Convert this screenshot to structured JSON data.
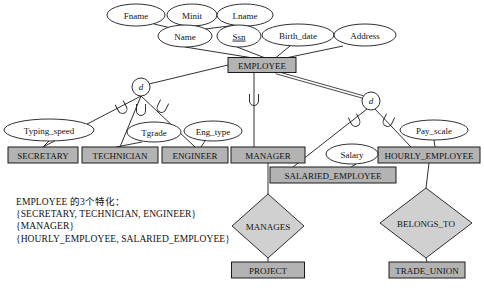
{
  "diagram": {
    "colors": {
      "entity_fill": "#b3b3b3",
      "relationship_fill": "#d0d0d0",
      "attribute_fill": "#ffffff",
      "line": "#1a1a1a",
      "text": "#111111"
    },
    "entities": [
      {
        "id": "employee",
        "label": "EMPLOYEE",
        "x": 262,
        "y": 65,
        "w": 68,
        "h": 15
      },
      {
        "id": "secretary",
        "label": "SECRETARY",
        "x": 43,
        "y": 155,
        "w": 70,
        "h": 16
      },
      {
        "id": "technician",
        "label": "TECHNICIAN",
        "x": 120,
        "y": 155,
        "w": 76,
        "h": 16
      },
      {
        "id": "engineer",
        "label": "ENGINEER",
        "x": 195,
        "y": 155,
        "w": 66,
        "h": 16
      },
      {
        "id": "manager",
        "label": "MANAGER",
        "x": 268,
        "y": 155,
        "w": 74,
        "h": 16
      },
      {
        "id": "hourly_employee",
        "label": "HOURLY_EMPLOYEE",
        "x": 429,
        "y": 155,
        "w": 102,
        "h": 16
      },
      {
        "id": "salaried_employee",
        "label": "SALARIED_EMPLOYEE",
        "x": 333,
        "y": 175,
        "w": 126,
        "h": 16
      },
      {
        "id": "project",
        "label": "PROJECT",
        "x": 268,
        "y": 270,
        "w": 73,
        "h": 16
      },
      {
        "id": "trade_union",
        "label": "TRADE_UNION",
        "x": 427,
        "y": 270,
        "w": 76,
        "h": 16
      }
    ],
    "attributes": [
      {
        "id": "fname",
        "label": "Fname",
        "x": 136,
        "y": 15,
        "rx": 29,
        "ry": 11,
        "key": false
      },
      {
        "id": "minit",
        "label": "Minit",
        "x": 192,
        "y": 15,
        "rx": 25,
        "ry": 11,
        "key": false
      },
      {
        "id": "lname",
        "label": "Lname",
        "x": 245,
        "y": 15,
        "rx": 28,
        "ry": 11,
        "key": false
      },
      {
        "id": "name",
        "label": "Name",
        "x": 185,
        "y": 36,
        "rx": 27,
        "ry": 11,
        "key": false
      },
      {
        "id": "ssn",
        "label": "Ssn",
        "x": 239,
        "y": 36,
        "rx": 22,
        "ry": 11,
        "key": true
      },
      {
        "id": "birth_date",
        "label": "Birth_date",
        "x": 298,
        "y": 35,
        "rx": 36,
        "ry": 11,
        "key": false
      },
      {
        "id": "address",
        "label": "Address",
        "x": 365,
        "y": 35,
        "rx": 31,
        "ry": 11,
        "key": false
      },
      {
        "id": "typing_speed",
        "label": "Typing_speed",
        "x": 49,
        "y": 130,
        "rx": 45,
        "ry": 11,
        "key": false
      },
      {
        "id": "tgrade",
        "label": "Tgrade",
        "x": 154,
        "y": 132,
        "rx": 27,
        "ry": 10,
        "key": false
      },
      {
        "id": "eng_type",
        "label": "Eng_type",
        "x": 213,
        "y": 131,
        "rx": 29,
        "ry": 10,
        "key": false
      },
      {
        "id": "salary",
        "label": "Salary",
        "x": 352,
        "y": 154,
        "rx": 26,
        "ry": 10,
        "key": false
      },
      {
        "id": "pay_scale",
        "label": "Pay_scale",
        "x": 434,
        "y": 130,
        "rx": 34,
        "ry": 10,
        "key": false
      }
    ],
    "specialization_circles": [
      {
        "id": "d-left",
        "label": "d",
        "x": 141,
        "y": 87,
        "r": 9
      },
      {
        "id": "d-right",
        "label": "d",
        "x": 371,
        "y": 101,
        "r": 9
      }
    ],
    "relationships": [
      {
        "id": "manages",
        "label": "MANAGES",
        "x": 268,
        "y": 226,
        "rx": 36,
        "ry": 32
      },
      {
        "id": "belongs_to",
        "label": "BELONGS_TO",
        "x": 426,
        "y": 223,
        "rx": 46,
        "ry": 35
      }
    ],
    "note": {
      "lines": [
        "EMPLOYEE 的3个特化：",
        "{SECRETARY, TECHNICIAN, ENGINEER}",
        "{MANAGER}",
        "{HOURLY_EMPLOYEE, SALARIED_EMPLOYEE}"
      ]
    }
  }
}
